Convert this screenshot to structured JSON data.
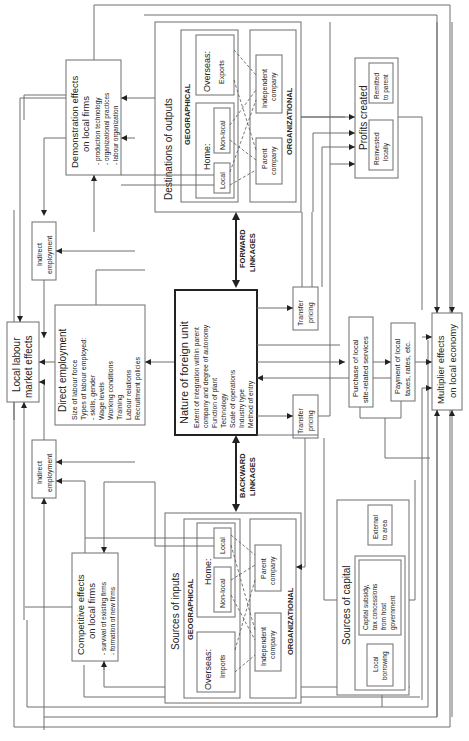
{
  "diagram": {
    "orientation": "rotated 90 degrees counter-clockwise",
    "center": {
      "title": "Nature of foreign unit",
      "items": [
        "Extent of integration within parent",
        "company and degree of autonomy",
        "Function of plant",
        "Technology",
        "Scale of operations",
        "Industry type",
        "Method of entry"
      ]
    },
    "forward_linkages": {
      "line1": "FORWARD",
      "line2": "LINKAGES"
    },
    "backward_linkages": {
      "line1": "BACKWARD",
      "line2": "LINKAGES"
    },
    "outputs": {
      "title": "Destinations of outputs",
      "geographical": "GEOGRAPHICAL",
      "organizational": "ORGANIZATIONAL",
      "overseas": "Overseas:",
      "exports": "Exports",
      "home": "Home:",
      "non_local": "Non-local",
      "local": "Local",
      "independent_1": "Independent",
      "independent_2": "company",
      "parent_1": "Parent",
      "parent_2": "company"
    },
    "inputs": {
      "title": "Sources of inputs",
      "geographical": "GEOGRAPHICAL",
      "organizational": "ORGANIZATIONAL",
      "overseas": "Overseas:",
      "imports": "Imports",
      "home": "Home:",
      "non_local": "Non-local",
      "local": "Local",
      "independent_1": "Independent",
      "independent_2": "company",
      "parent_1": "Parent",
      "parent_2": "company"
    },
    "demonstration": {
      "title1": "Demonstration effects",
      "title2": "on local firms",
      "items": [
        "- production technology",
        "- organizational practices",
        "- labour organization"
      ]
    },
    "competitive": {
      "title1": "Competitive effects",
      "title2": "on local firms",
      "items": [
        "- survival of existing firms",
        "- formation of new firms"
      ]
    },
    "indirect_top": {
      "line1": "Indirect",
      "line2": "employment"
    },
    "indirect_bottom": {
      "line1": "Indirect",
      "line2": "employment"
    },
    "labour_market": {
      "line1": "Local labour",
      "line2": "market effects"
    },
    "direct_employment": {
      "title": "Direct employment",
      "items": [
        "Size of labour force",
        "Types of labour employed:",
        "- skills, gender",
        "Wage levels",
        "Working conditions",
        "Training",
        "Labour relations",
        "Recruitment policies"
      ]
    },
    "transfer_top": {
      "line1": "Transfer",
      "line2": "pricing"
    },
    "transfer_bottom": {
      "line1": "Transfer",
      "line2": "pricing"
    },
    "profits": {
      "title": "Profits created",
      "remitted1": "Remitted",
      "remitted2": "to parent",
      "reinvested1": "Reinvested",
      "reinvested2": "locally"
    },
    "services": {
      "line1": "Purchase of local",
      "line2": "site-related services"
    },
    "taxes": {
      "line1": "Payment of local",
      "line2": "taxes, rates, etc."
    },
    "multiplier": {
      "line1": "Multiplier effects",
      "line2": "on local economy"
    },
    "capital": {
      "title": "Sources of capital",
      "external1": "External",
      "external2": "to area",
      "subsidy": [
        "Capital subsidy,",
        "tax concessions",
        "from host",
        "government"
      ],
      "local1": "Local",
      "local2": "borrowing"
    }
  }
}
